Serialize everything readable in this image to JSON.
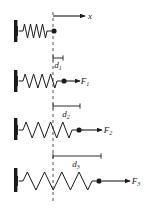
{
  "figure": {
    "background_color": "#ffffff",
    "stroke_color": "#1a1a1a",
    "dashed_line_color": "#555555",
    "width": 152,
    "height": 210,
    "axis": {
      "label": "x",
      "arrow_start_x": 53,
      "arrow_end_x": 85,
      "arrow_y": 16,
      "label_x": 90,
      "label_y": 19
    },
    "reference_line": {
      "name": "equilibrium-reference-line",
      "x": 53,
      "y_top": 12,
      "y_bottom": 202,
      "dash": "3,3"
    },
    "panels": [
      {
        "id": "panel-rest",
        "wall_x": 14,
        "wall_y": 20,
        "wall_height": 22,
        "spring_start_x": 19,
        "spring_end_x": 51,
        "spring_center_y": 31,
        "spring_coils": 4,
        "spring_amplitude": 7,
        "mass_x": 54,
        "mass_y": 31,
        "mass_radius": 2.6,
        "displacement_label": "",
        "displacement_sub": "",
        "displacement_start_x": 0,
        "displacement_end_x": 0,
        "displacement_y": 0,
        "force_label": "",
        "force_sub": "",
        "force_arrow_start_x": 0,
        "force_arrow_end_x": 0,
        "force_label_x": 0
      },
      {
        "id": "panel-force-1",
        "wall_x": 14,
        "wall_y": 70,
        "wall_height": 22,
        "spring_start_x": 19,
        "spring_end_x": 61,
        "spring_center_y": 81,
        "spring_coils": 4,
        "spring_amplitude": 7,
        "mass_x": 64,
        "mass_y": 81,
        "mass_radius": 2.6,
        "displacement_label": "d",
        "displacement_sub": "1",
        "displacement_start_x": 53,
        "displacement_end_x": 63,
        "displacement_y": 58,
        "displacement_label_x": 58,
        "displacement_label_y": 68,
        "force_label": "F",
        "force_sub": "1",
        "force_arrow_start_x": 66,
        "force_arrow_end_x": 80,
        "force_label_x": 85,
        "force_label_y": 84
      },
      {
        "id": "panel-force-2",
        "wall_x": 14,
        "wall_y": 118,
        "wall_height": 22,
        "spring_start_x": 19,
        "spring_end_x": 76,
        "spring_center_y": 130,
        "spring_coils": 4,
        "spring_amplitude": 8,
        "mass_x": 79,
        "mass_y": 130,
        "mass_radius": 2.6,
        "displacement_label": "d",
        "displacement_sub": "2",
        "displacement_start_x": 53,
        "displacement_end_x": 80,
        "displacement_y": 106,
        "displacement_label_x": 66,
        "displacement_label_y": 117,
        "force_label": "F",
        "force_sub": "2",
        "force_arrow_start_x": 81,
        "force_arrow_end_x": 102,
        "force_label_x": 108,
        "force_label_y": 133
      },
      {
        "id": "panel-force-3",
        "wall_x": 14,
        "wall_y": 168,
        "wall_height": 24,
        "spring_start_x": 19,
        "spring_end_x": 96,
        "spring_center_y": 181,
        "spring_coils": 4,
        "spring_amplitude": 9,
        "mass_x": 99,
        "mass_y": 181,
        "mass_radius": 2.6,
        "displacement_label": "d",
        "displacement_sub": "3",
        "displacement_start_x": 53,
        "displacement_end_x": 101,
        "displacement_y": 156,
        "displacement_label_x": 76,
        "displacement_label_y": 167,
        "force_label": "F",
        "force_sub": "3",
        "force_arrow_start_x": 102,
        "force_arrow_end_x": 130,
        "force_label_x": 136,
        "force_label_y": 184
      }
    ]
  }
}
